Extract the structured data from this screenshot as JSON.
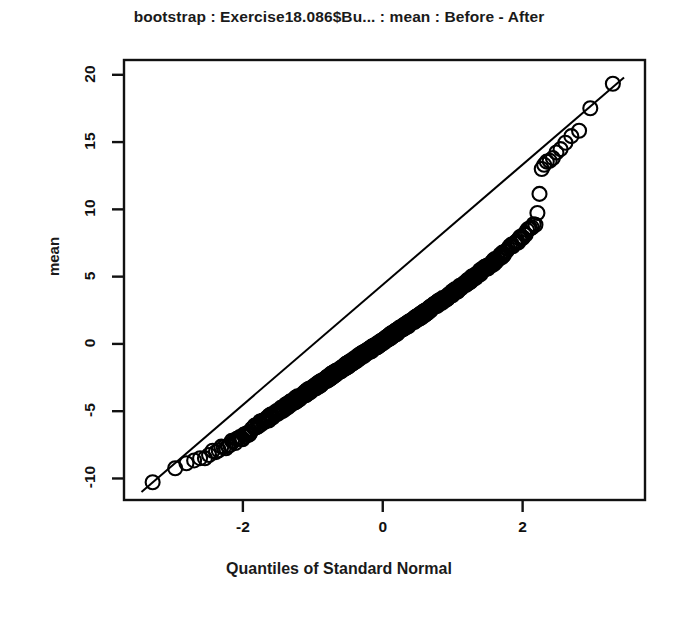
{
  "chart_data": {
    "type": "scatter",
    "title": "bootstrap : Exercise18.086$Bu... : mean : Before - After",
    "xlabel": "Quantiles of Standard Normal",
    "ylabel": "mean",
    "grid": false,
    "legend": "none",
    "marker": "open-circle",
    "reference_line": {
      "description": "straight qq reference line through the quantiles",
      "x": [
        -3.45,
        3.45
      ],
      "y": [
        -11.0,
        19.8
      ]
    },
    "xlim": [
      -3.7,
      3.75
    ],
    "ylim": [
      -11.6,
      21.1
    ],
    "xticks": [
      -2,
      0,
      2
    ],
    "xtick_labels": [
      "-2",
      "0",
      "2"
    ],
    "yticks": [
      -10,
      -5,
      0,
      5,
      10,
      15,
      20
    ],
    "ytick_labels": [
      "-10",
      "-5",
      "0",
      "5",
      "10",
      "15",
      "20"
    ],
    "n_points": 1000,
    "points": [
      {
        "x": -3.35,
        "y": -10.6
      },
      {
        "x": -2.95,
        "y": -9.3
      },
      {
        "x": -2.78,
        "y": -8.95
      },
      {
        "x": -2.66,
        "y": -8.7
      },
      {
        "x": -2.56,
        "y": -8.45
      },
      {
        "x": -2.48,
        "y": -8.2
      },
      {
        "x": -2.41,
        "y": -8.05
      },
      {
        "x": -2.34,
        "y": -7.85
      },
      {
        "x": -2.28,
        "y": -7.7
      },
      {
        "x": -2.22,
        "y": -7.55
      },
      {
        "x": -2.17,
        "y": -7.4
      },
      {
        "x": -2.12,
        "y": -7.25
      },
      {
        "x": -2.07,
        "y": -7.1
      },
      {
        "x": -2.02,
        "y": -7.0
      },
      {
        "x": -1.98,
        "y": -6.85
      },
      {
        "x": -1.93,
        "y": -6.7
      },
      {
        "x": -1.89,
        "y": -6.5
      },
      {
        "x": -1.85,
        "y": -6.35
      },
      {
        "x": -1.81,
        "y": -6.1
      },
      {
        "x": -1.77,
        "y": -5.95
      },
      {
        "x": -1.73,
        "y": -5.85
      },
      {
        "x": -1.69,
        "y": -5.75
      },
      {
        "x": -1.65,
        "y": -5.6
      },
      {
        "x": -1.61,
        "y": -5.45
      },
      {
        "x": -1.57,
        "y": -5.3
      },
      {
        "x": -1.5,
        "y": -5.05
      },
      {
        "x": -1.4,
        "y": -4.7
      },
      {
        "x": -1.3,
        "y": -4.35
      },
      {
        "x": -1.2,
        "y": -4.0
      },
      {
        "x": -1.1,
        "y": -3.65
      },
      {
        "x": -1.0,
        "y": -3.3
      },
      {
        "x": -0.9,
        "y": -2.95
      },
      {
        "x": -0.8,
        "y": -2.6
      },
      {
        "x": -0.7,
        "y": -2.25
      },
      {
        "x": -0.6,
        "y": -1.9
      },
      {
        "x": -0.5,
        "y": -1.55
      },
      {
        "x": -0.4,
        "y": -1.2
      },
      {
        "x": -0.3,
        "y": -0.85
      },
      {
        "x": -0.2,
        "y": -0.5
      },
      {
        "x": -0.1,
        "y": -0.15
      },
      {
        "x": 0.0,
        "y": 0.2
      },
      {
        "x": 0.1,
        "y": 0.55
      },
      {
        "x": 0.2,
        "y": 0.9
      },
      {
        "x": 0.3,
        "y": 1.25
      },
      {
        "x": 0.4,
        "y": 1.6
      },
      {
        "x": 0.5,
        "y": 1.95
      },
      {
        "x": 0.6,
        "y": 2.3
      },
      {
        "x": 0.7,
        "y": 2.7
      },
      {
        "x": 0.8,
        "y": 3.05
      },
      {
        "x": 0.9,
        "y": 3.4
      },
      {
        "x": 1.0,
        "y": 3.8
      },
      {
        "x": 1.1,
        "y": 4.15
      },
      {
        "x": 1.2,
        "y": 4.55
      },
      {
        "x": 1.3,
        "y": 4.95
      },
      {
        "x": 1.4,
        "y": 5.35
      },
      {
        "x": 1.5,
        "y": 5.75
      },
      {
        "x": 1.6,
        "y": 6.15
      },
      {
        "x": 1.7,
        "y": 6.6
      },
      {
        "x": 1.8,
        "y": 7.05
      },
      {
        "x": 1.9,
        "y": 7.5
      },
      {
        "x": 2.0,
        "y": 8.0
      },
      {
        "x": 2.1,
        "y": 8.5
      },
      {
        "x": 2.2,
        "y": 9.1
      },
      {
        "x": 2.28,
        "y": 13.3
      },
      {
        "x": 2.36,
        "y": 13.6
      },
      {
        "x": 2.44,
        "y": 13.95
      },
      {
        "x": 2.52,
        "y": 14.3
      },
      {
        "x": 2.6,
        "y": 14.75
      },
      {
        "x": 2.68,
        "y": 15.2
      },
      {
        "x": 2.76,
        "y": 15.6
      },
      {
        "x": 2.84,
        "y": 15.95
      },
      {
        "x": 2.95,
        "y": 17.4
      },
      {
        "x": 3.08,
        "y": 19.4
      },
      {
        "x": 3.42,
        "y": 19.5
      }
    ]
  },
  "axes": {
    "title": "bootstrap : Exercise18.086$Bu... : mean : Before - After",
    "x_axis_label": "Quantiles of Standard Normal",
    "y_axis_label": "mean",
    "x_ticks": [
      "-2",
      "0",
      "2"
    ],
    "y_ticks": [
      "-10",
      "-5",
      "0",
      "5",
      "10",
      "15",
      "20"
    ]
  },
  "style": {
    "background": "#ffffff",
    "foreground": "#111111",
    "marker_stroke": "#000000",
    "line_color": "#000000"
  }
}
